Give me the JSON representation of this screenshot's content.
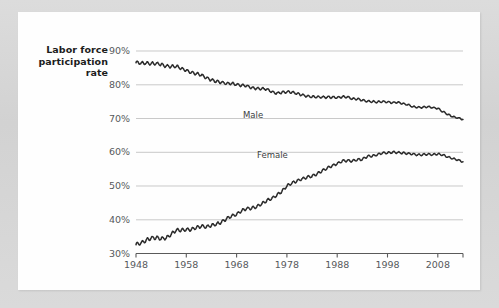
{
  "chart_data": {
    "type": "line",
    "title": "",
    "ylabel": "Labor force participation rate",
    "xlabel": "",
    "xlim": [
      1948,
      2013
    ],
    "ylim": [
      30,
      90
    ],
    "grid": true,
    "legend_position": "inline-annotations",
    "yticks": [
      "30%",
      "40%",
      "50%",
      "60%",
      "70%",
      "80%",
      "90%"
    ],
    "ytick_values": [
      30,
      40,
      50,
      60,
      70,
      80,
      90
    ],
    "xticks": [
      "1948",
      "1958",
      "1968",
      "1978",
      "1988",
      "1998",
      "2008"
    ],
    "xtick_values": [
      1948,
      1958,
      1968,
      1978,
      1988,
      1998,
      2008
    ],
    "annotations": [
      {
        "text": "Male",
        "x": 1985,
        "y": 74
      },
      {
        "text": "Female",
        "x": 1971,
        "y": 56
      }
    ],
    "series": [
      {
        "name": "Male",
        "label": "Male",
        "color": "#2b2b2b",
        "x": [
          1948,
          1949,
          1950,
          1951,
          1952,
          1953,
          1954,
          1955,
          1956,
          1957,
          1958,
          1959,
          1960,
          1961,
          1962,
          1963,
          1964,
          1965,
          1966,
          1967,
          1968,
          1969,
          1970,
          1971,
          1972,
          1973,
          1974,
          1975,
          1976,
          1977,
          1978,
          1979,
          1980,
          1981,
          1982,
          1983,
          1984,
          1985,
          1986,
          1987,
          1988,
          1989,
          1990,
          1991,
          1992,
          1993,
          1994,
          1995,
          1996,
          1997,
          1998,
          1999,
          2000,
          2001,
          2002,
          2003,
          2004,
          2005,
          2006,
          2007,
          2008,
          2009,
          2010,
          2011,
          2012,
          2013
        ],
        "values": [
          86.6,
          86.4,
          86.4,
          86.3,
          86.3,
          86.0,
          85.5,
          85.4,
          85.5,
          84.8,
          84.2,
          83.7,
          83.3,
          82.9,
          82.0,
          81.4,
          81.0,
          80.7,
          80.4,
          80.4,
          80.1,
          79.8,
          79.7,
          79.1,
          78.9,
          78.8,
          78.7,
          77.9,
          77.5,
          77.7,
          77.9,
          77.8,
          77.4,
          77.0,
          76.6,
          76.4,
          76.4,
          76.3,
          76.3,
          76.3,
          76.2,
          76.4,
          76.4,
          75.8,
          75.8,
          75.4,
          75.1,
          75.0,
          74.9,
          75.0,
          74.9,
          74.7,
          74.8,
          74.4,
          74.1,
          73.5,
          73.3,
          73.3,
          73.5,
          73.2,
          73.0,
          72.0,
          71.2,
          70.5,
          70.2,
          69.7
        ]
      },
      {
        "name": "Female",
        "label": "Female",
        "color": "#2b2b2b",
        "x": [
          1948,
          1949,
          1950,
          1951,
          1952,
          1953,
          1954,
          1955,
          1956,
          1957,
          1958,
          1959,
          1960,
          1961,
          1962,
          1963,
          1964,
          1965,
          1966,
          1967,
          1968,
          1969,
          1970,
          1971,
          1972,
          1973,
          1974,
          1975,
          1976,
          1977,
          1978,
          1979,
          1980,
          1981,
          1982,
          1983,
          1984,
          1985,
          1986,
          1987,
          1988,
          1989,
          1990,
          1991,
          1992,
          1993,
          1994,
          1995,
          1996,
          1997,
          1998,
          1999,
          2000,
          2001,
          2002,
          2003,
          2004,
          2005,
          2006,
          2007,
          2008,
          2009,
          2010,
          2011,
          2012,
          2013
        ],
        "values": [
          32.7,
          33.1,
          33.9,
          34.6,
          34.7,
          34.4,
          34.6,
          35.7,
          36.9,
          36.9,
          37.1,
          37.1,
          37.7,
          38.1,
          37.9,
          38.3,
          38.7,
          39.3,
          40.3,
          41.1,
          41.6,
          42.7,
          43.3,
          43.4,
          43.9,
          44.7,
          45.7,
          46.3,
          47.3,
          48.4,
          50.0,
          50.9,
          51.5,
          52.1,
          52.6,
          52.9,
          53.6,
          54.5,
          55.3,
          56.0,
          56.6,
          57.4,
          57.5,
          57.4,
          57.8,
          57.9,
          58.8,
          58.9,
          59.3,
          59.8,
          59.8,
          60.0,
          59.9,
          59.8,
          59.6,
          59.5,
          59.2,
          59.3,
          59.4,
          59.3,
          59.5,
          59.2,
          58.6,
          58.1,
          57.7,
          57.2
        ]
      }
    ]
  },
  "axis_title": {
    "line1": "Labor force",
    "line2": "participation",
    "line3": "rate"
  },
  "colors": {
    "line": "#2b2b2b",
    "gridline": "#c9c9c9",
    "axis": "#5a5a5a",
    "tick_text": "#56595c",
    "title_text": "#1c1c1c",
    "card_background": "#fefefe",
    "page_background": "#d6d6d6"
  }
}
